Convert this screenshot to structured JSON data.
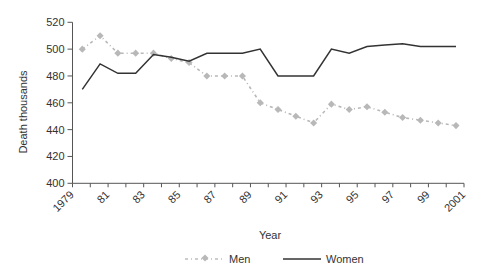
{
  "chart_data": {
    "type": "line",
    "title": "",
    "xlabel": "Year",
    "ylabel": "Death thousands",
    "ylim": [
      400,
      520
    ],
    "yticks": [
      400,
      420,
      440,
      460,
      480,
      500,
      520
    ],
    "xtick_labels": [
      "1979",
      "81",
      "83",
      "85",
      "87",
      "89",
      "91",
      "93",
      "95",
      "97",
      "99",
      "2001"
    ],
    "grid": false,
    "legend_position": "bottom",
    "x": [
      1979,
      1980,
      1981,
      1982,
      1983,
      1984,
      1985,
      1986,
      1987,
      1988,
      1989,
      1990,
      1991,
      1992,
      1993,
      1994,
      1995,
      1996,
      1997,
      1998,
      1999,
      2000
    ],
    "series": [
      {
        "name": "Men",
        "color": "#b8b8b8",
        "style": "dash-dot with diamond markers",
        "values": [
          500,
          510,
          497,
          497,
          497,
          493,
          490,
          480,
          480,
          480,
          460,
          455,
          450,
          445,
          459,
          455,
          457,
          453,
          449,
          447,
          445,
          443
        ]
      },
      {
        "name": "Women",
        "color": "#333333",
        "style": "solid",
        "values": [
          470,
          489,
          482,
          482,
          496,
          494,
          491,
          497,
          497,
          497,
          500,
          480,
          480,
          480,
          500,
          497,
          502,
          503,
          504,
          502,
          502,
          502
        ]
      }
    ]
  },
  "legend": {
    "men_label": "Men",
    "women_label": "Women"
  },
  "axes": {
    "x_title": "Year",
    "y_title": "Death thousands"
  }
}
